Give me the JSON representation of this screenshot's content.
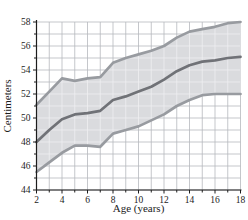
{
  "chart_data": {
    "type": "line",
    "title": "",
    "xlabel": "Age (years)",
    "ylabel": "Centimeters",
    "xlim": [
      2,
      18
    ],
    "ylim": [
      44,
      58
    ],
    "x_major_ticks": [
      2,
      4,
      6,
      8,
      10,
      12,
      14,
      16,
      18
    ],
    "y_major_ticks": [
      44,
      46,
      48,
      50,
      52,
      54,
      56,
      58
    ],
    "minor_tick_step": 1,
    "grid": true,
    "legend": "none",
    "x": [
      2,
      3,
      4,
      5,
      6,
      7,
      8,
      9,
      10,
      11,
      12,
      13,
      14,
      15,
      16,
      17,
      18
    ],
    "series": [
      {
        "name": "upper_curve",
        "values": [
          51.1,
          52.2,
          53.3,
          53.1,
          53.3,
          53.4,
          54.6,
          55.0,
          55.3,
          55.6,
          56.0,
          56.7,
          57.2,
          57.4,
          57.6,
          57.9,
          58.0
        ]
      },
      {
        "name": "middle_curve",
        "values": [
          48.0,
          49.0,
          49.9,
          50.3,
          50.4,
          50.6,
          51.5,
          51.8,
          52.2,
          52.6,
          53.2,
          53.9,
          54.4,
          54.7,
          54.8,
          55.0,
          55.1
        ]
      },
      {
        "name": "lower_curve",
        "values": [
          45.5,
          46.3,
          47.1,
          47.7,
          47.7,
          47.6,
          48.7,
          49.0,
          49.3,
          49.8,
          50.3,
          51.0,
          51.5,
          51.9,
          52.0,
          52.0,
          52.0
        ]
      }
    ],
    "band_between": [
      "upper_curve",
      "lower_curve"
    ],
    "style": {
      "outer_curve_color": "#989ba0",
      "middle_curve_color": "#707277",
      "curve_width": 2.7,
      "band_fill": "#dadbde",
      "grid_color_outside_band": "#b6b9be",
      "grid_color_inside_band": "#efeff1",
      "axis_color": "#1c1c1c",
      "background": "#ffffff"
    }
  }
}
